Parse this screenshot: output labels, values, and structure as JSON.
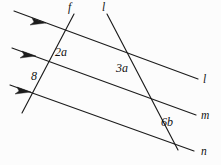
{
  "figure": {
    "background_color": "#fcfcfc",
    "stroke_color": "#1c1c1c",
    "width": 221,
    "height": 165
  },
  "line_labels": {
    "parallel_top": "l",
    "parallel_middle": "m",
    "parallel_bottom": "n",
    "transversal_left": "f",
    "transversal_right": "l"
  },
  "angle_labels": {
    "upper_left": "2a",
    "upper_right": "3a",
    "lower_left": "8",
    "lower_right": "6b"
  },
  "geometry": {
    "parallel_lines": [
      {
        "name": "l",
        "x1": 14,
        "y1": 11,
        "x2": 198,
        "y2": 79
      },
      {
        "name": "m",
        "x1": 12,
        "y1": 48,
        "x2": 196,
        "y2": 115
      },
      {
        "name": "n",
        "x1": 10,
        "y1": 85,
        "x2": 194,
        "y2": 151
      }
    ],
    "transversals": [
      {
        "name": "f",
        "x1": 74,
        "y1": 14,
        "x2": 22,
        "y2": 113
      },
      {
        "name": "l",
        "x1": 107,
        "y1": 14,
        "x2": 178,
        "y2": 150
      }
    ],
    "intersection_top": {
      "x": 89,
      "y": 42
    },
    "convergence_bottom": {
      "x": 176,
      "y": 148
    }
  },
  "arrows": {
    "count": 3,
    "direction": "down-right",
    "positions": [
      {
        "x": 40,
        "y": 21
      },
      {
        "x": 30,
        "y": 54
      },
      {
        "x": 25,
        "y": 90
      }
    ]
  }
}
